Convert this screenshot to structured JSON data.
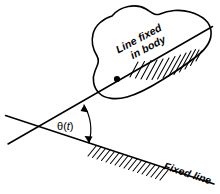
{
  "figure": {
    "kind": "mechanics-diagram",
    "background_color": "#ffffff",
    "ink_color": "#000000"
  },
  "labels": {
    "body_line_label_line1": "Line fixed",
    "body_line_label_line2": "in body",
    "fixed_line_label": "Fixed line",
    "angle_symbol": "θ",
    "angle_open_paren": "(",
    "angle_variable": "t",
    "angle_close_paren": ")"
  },
  "geometry": {
    "intersection": {
      "x": 38,
      "y": 126
    },
    "pivot_point": {
      "x": 117,
      "y": 79
    },
    "body_line": {
      "x1": 8,
      "y1": 144,
      "x2": 213,
      "y2": 26
    },
    "fixed_line": {
      "x1": 5,
      "y1": 115,
      "x2": 214,
      "y2": 184
    },
    "body_line_angle_deg": -30,
    "fixed_line_angle_deg": 18,
    "angle_between_deg": 48
  }
}
